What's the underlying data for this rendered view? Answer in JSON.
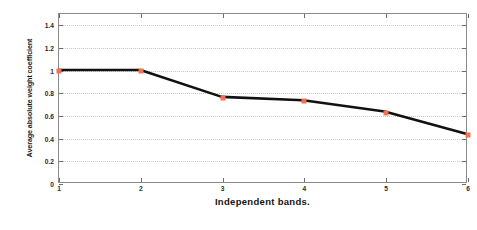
{
  "figure": {
    "background_color": "#ffffff",
    "axis_color": "#8a8a8a",
    "grid_color": "#c9c9c9"
  },
  "chart_data": {
    "type": "line",
    "title": "",
    "xlabel": "Independent bands.",
    "ylabel": "Average absolute weight coefficient",
    "x": [
      1,
      2,
      3,
      4,
      5,
      6
    ],
    "values": [
      1.0,
      1.0,
      0.76,
      0.73,
      0.63,
      0.43
    ],
    "series": [
      {
        "name": "Average absolute weight coefficient",
        "values": [
          1.0,
          1.0,
          0.76,
          0.73,
          0.63,
          0.43
        ],
        "line_color": "#111111",
        "marker_color": "#f4704f",
        "marker_style": "square"
      }
    ],
    "xlim": [
      1,
      6
    ],
    "ylim": [
      0,
      1.5
    ],
    "xticks": [
      1,
      2,
      3,
      4,
      5,
      6
    ],
    "xtick_labels": [
      "1",
      "2",
      "3",
      "4",
      "5",
      "6"
    ],
    "yticks": [
      0,
      0.2,
      0.4,
      0.6,
      0.8,
      1,
      1.2,
      1.4
    ],
    "ytick_labels": [
      "0",
      "0.2",
      "0.4",
      "0.6",
      "0.8",
      "1",
      "1.2",
      "1.4"
    ],
    "grid": "horizontal-dotted",
    "legend": null,
    "legend_position": "none"
  }
}
